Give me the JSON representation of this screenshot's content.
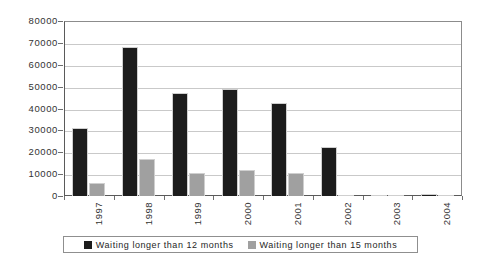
{
  "chart_data": {
    "type": "bar",
    "title": "",
    "subtitle": "",
    "xlabel": "",
    "ylabel": "",
    "categories": [
      "1997",
      "1998",
      "1999",
      "2000",
      "2001",
      "2002",
      "2003",
      "2004"
    ],
    "series": [
      {
        "name": "Waiting longer than 12 months",
        "color": "#1c1c1c",
        "values": [
          31000,
          68000,
          47000,
          49000,
          42500,
          22300,
          0,
          700
        ]
      },
      {
        "name": "Waiting longer than 15 months",
        "color": "#a0a0a0",
        "values": [
          6000,
          16800,
          10300,
          12000,
          10400,
          0,
          0,
          0
        ]
      }
    ],
    "ylim": [
      0,
      80000
    ],
    "ytick_values": [
      0,
      10000,
      20000,
      30000,
      40000,
      50000,
      60000,
      70000,
      80000
    ],
    "ytick_labels": [
      "0",
      "10000",
      "20000",
      "30000",
      "40000",
      "50000",
      "60000",
      "70000",
      "80000"
    ],
    "grid": true,
    "grid_axis": "y",
    "legend_position": "bottom",
    "x_tick_label_rotation": -90
  },
  "legend": {
    "entries": [
      {
        "label": "Waiting longer than 12 months",
        "swatch": "legend-swatch-black"
      },
      {
        "label": "Waiting longer than 15 months",
        "swatch": "legend-swatch-grey"
      }
    ]
  },
  "caption_fragment": ""
}
